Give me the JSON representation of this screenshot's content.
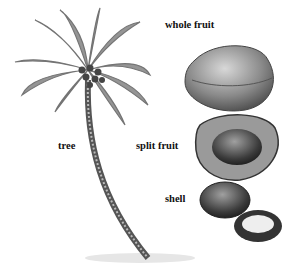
{
  "diagram": {
    "labels": {
      "whole_fruit": "whole fruit",
      "tree": "tree",
      "split_fruit": "split fruit",
      "shell": "shell"
    },
    "parts": [
      "palm tree",
      "whole coconut fruit",
      "split coconut fruit",
      "coconut shell",
      "opened shell with flesh"
    ]
  }
}
